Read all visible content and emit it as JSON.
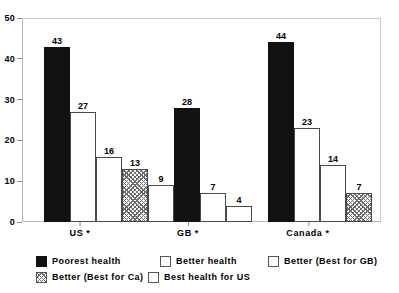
{
  "chart_data": {
    "type": "bar",
    "title": "",
    "subtitle": "",
    "xlabel": "",
    "ylabel": "",
    "ylim": [
      0,
      50
    ],
    "yticks": [
      0,
      10,
      20,
      30,
      40,
      50
    ],
    "ytick_labels": [
      "0",
      "10",
      "20",
      "30",
      "40",
      "50"
    ],
    "grid": false,
    "legend_position": "bottom",
    "categories": [
      "US *",
      "GB *",
      "Canada *"
    ],
    "series": [
      {
        "name": "Poorest health",
        "pattern": "solid",
        "values": [
          43,
          28,
          44
        ]
      },
      {
        "name": "Better health",
        "pattern": "hollow",
        "values": [
          27,
          7,
          23
        ]
      },
      {
        "name": "Better (Best for GB)",
        "pattern": "hollow",
        "values": [
          16,
          4,
          14
        ]
      },
      {
        "name": "Better (Best for Ca)",
        "pattern": "hatched",
        "values": [
          13,
          null,
          7
        ]
      },
      {
        "name": "Best health for US",
        "pattern": "hollow",
        "values": [
          9,
          null,
          null
        ]
      }
    ],
    "groups": [
      {
        "label": "US *",
        "bars": [
          {
            "value": 43,
            "label": "43",
            "pattern": "solid",
            "series": "Poorest health"
          },
          {
            "value": 27,
            "label": "27",
            "pattern": "hollow",
            "series": "Better health"
          },
          {
            "value": 16,
            "label": "16",
            "pattern": "hollow",
            "series": "Better (Best for GB)"
          },
          {
            "value": 13,
            "label": "13",
            "pattern": "hatched",
            "series": "Better (Best for Ca)"
          },
          {
            "value": 9,
            "label": "9",
            "pattern": "hollow",
            "series": "Best health for US"
          }
        ]
      },
      {
        "label": "GB *",
        "bars": [
          {
            "value": 28,
            "label": "28",
            "pattern": "solid",
            "series": "Poorest health"
          },
          {
            "value": 7,
            "label": "7",
            "pattern": "hollow",
            "series": "Better health"
          },
          {
            "value": 4,
            "label": "4",
            "pattern": "hollow",
            "series": "Better (Best for GB)"
          }
        ]
      },
      {
        "label": "Canada *",
        "bars": [
          {
            "value": 44,
            "label": "44",
            "pattern": "solid",
            "series": "Poorest health"
          },
          {
            "value": 23,
            "label": "23",
            "pattern": "hollow",
            "series": "Better health"
          },
          {
            "value": 14,
            "label": "14",
            "pattern": "hollow",
            "series": "Better (Best for GB)"
          },
          {
            "value": 7,
            "label": "7",
            "pattern": "hatched",
            "series": "Better (Best for Ca)"
          }
        ]
      }
    ]
  },
  "legend": {
    "rows": [
      [
        {
          "label": "Poorest health",
          "pattern": "solid",
          "x": 0
        },
        {
          "label": "Better health",
          "pattern": "hollow",
          "x": 124
        },
        {
          "label": "Better (Best for GB)",
          "pattern": "hollow",
          "x": 232
        }
      ],
      [
        {
          "label": "Better (Best for Ca)",
          "pattern": "hatched",
          "x": 0
        },
        {
          "label": "Best health for US",
          "pattern": "hollow",
          "x": 112
        }
      ]
    ]
  },
  "colors": {
    "solid_fill": "#121212",
    "hollow_fill": "#ffffff",
    "bar_outline": "#4a4a4a",
    "hatch_stroke": "#6e6e6e",
    "frame": "#b9b9b9",
    "text": "#000000",
    "background": "#ffffff"
  }
}
